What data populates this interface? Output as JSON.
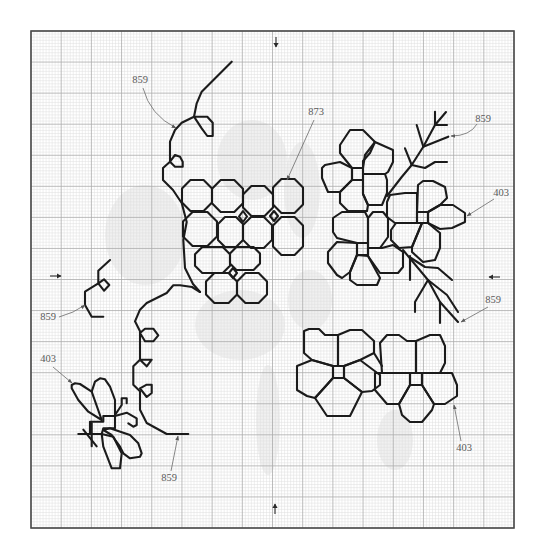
{
  "canvas": {
    "width": 543,
    "height": 556
  },
  "grid": {
    "x0": 31,
    "y0": 31,
    "x1": 514,
    "y1": 528,
    "cols": 160,
    "rows": 160,
    "major_every": 10
  },
  "colors": {
    "stitch": "#1b1b1b",
    "grid_minor": "#dedede",
    "grid_major": "#ababab",
    "frame": "#4a4a4a",
    "label": "#5a5a5a"
  },
  "floss_codes": [
    "403",
    "859",
    "873"
  ],
  "center_markers": [
    {
      "name": "top-center-arrow",
      "dir": "down",
      "x": 276,
      "y1": 37,
      "y2": 47
    },
    {
      "name": "bottom-center-arrow",
      "dir": "up",
      "x": 275,
      "y1": 514,
      "y2": 504
    },
    {
      "name": "left-center-arrow",
      "dir": "right",
      "y": 276,
      "x1": 50,
      "x2": 61
    },
    {
      "name": "right-center-arrow",
      "dir": "left",
      "y": 277,
      "x1": 500,
      "x2": 489
    }
  ],
  "ghost_areas": [
    {
      "cx": 252,
      "cy": 160,
      "rx": 35,
      "ry": 40
    },
    {
      "cx": 145,
      "cy": 235,
      "rx": 40,
      "ry": 50
    },
    {
      "cx": 240,
      "cy": 325,
      "rx": 45,
      "ry": 35
    },
    {
      "cx": 268,
      "cy": 420,
      "rx": 12,
      "ry": 55
    },
    {
      "cx": 310,
      "cy": 300,
      "rx": 22,
      "ry": 30
    },
    {
      "cx": 395,
      "cy": 440,
      "rx": 18,
      "ry": 30
    },
    {
      "cx": 302,
      "cy": 190,
      "rx": 18,
      "ry": 48
    }
  ],
  "labels": [
    {
      "text": "859",
      "x": 140,
      "y": 83,
      "leader": "M143,88 Q150,115 176,128",
      "arrow": true
    },
    {
      "text": "873",
      "x": 316,
      "y": 115,
      "leader": "M314,120 L287,180",
      "arrow": true
    },
    {
      "text": "859",
      "x": 483,
      "y": 122,
      "leader": "M477,124 Q470,136 451,136",
      "arrow": true
    },
    {
      "text": "403",
      "x": 501,
      "y": 196,
      "leader": "M494,199 L467,216",
      "arrow": true
    },
    {
      "text": "859",
      "x": 48,
      "y": 320,
      "leader": "M59,317 Q74,313 85,305",
      "arrow": true
    },
    {
      "text": "859",
      "x": 493,
      "y": 303,
      "leader": "M488,307 L461,322",
      "arrow": true
    },
    {
      "text": "403",
      "x": 48,
      "y": 362,
      "leader": "M53,367 L72,383",
      "arrow": true
    },
    {
      "text": "859",
      "x": 169,
      "y": 481,
      "leader": "M171,471 L178,436",
      "arrow": true
    },
    {
      "text": "403",
      "x": 464,
      "y": 451,
      "leader": "M461,441 L454,405",
      "arrow": true
    }
  ],
  "backstitch": [
    {
      "floss": "859",
      "name": "vines-and-branches",
      "paths": [
        {
          "pts": "231.7,61.7 201.7,91.7 196.7,103.3 194,116.7 181.7,122.7 175,130 170,141.7 170,161.7 163,168 163,180 173,190 181.7,203 186.7,222 183.3,240 185,268 193,284 200,292"
        },
        {
          "pts": "194,116.7 207.3,116.7 212.7,122.7 212.7,136 207.3,136 201.7,128.3",
          "closed": true
        },
        {
          "pts": "170,161.7 175,155 180,156.7 182.7,161.7 182.7,166.7 175,166.7",
          "closed": true
        },
        {
          "pts": "200,292 192,287 180,285.3 173.3,285.3 166.7,293 146.7,303 140,309.7 135,321.3 140,331.3 140,359.7 133.3,366.3 133.3,384.7 140,391.3 140,409.7 146.7,423 166.7,434 188.3,434"
        },
        {
          "pts": "140,333 145,328.7 153.3,328.7 158.3,335.3 153.3,341.3 145,341.3",
          "closed": true
        },
        {
          "pts": "140,359.7 151.7,359.7 146.7,366.3",
          "closed": true
        },
        {
          "pts": "140,388.3 146.7,384.7 151.7,384.7 151.7,393 146.7,397",
          "closed": true
        },
        {
          "pts": "110,260 98.3,270.7 98.3,283.3 85,291.7 85,305 91.7,316.7 103.3,316.7"
        },
        {
          "pts": "98.3,283.3 104,279.3 109.3,285 104,290.7",
          "closed": true
        },
        {
          "pts": "387,196 401.7,177 411.7,165 423.3,146.7 435,125 446,112"
        },
        {
          "pts": "411.7,165 405,148.3"
        },
        {
          "pts": "411.7,165 425,168 435,162 447,162"
        },
        {
          "pts": "423.3,146.7 416.7,125"
        },
        {
          "pts": "423.3,146.7 448.3,136.7"
        },
        {
          "pts": "435,125 435,111.7"
        },
        {
          "pts": "435,125 447,125"
        },
        {
          "pts": "403,250 428,280 440,302 458,322"
        },
        {
          "pts": "411,258 425,267 438,268 452,280"
        },
        {
          "pts": "410,256 410,280"
        },
        {
          "pts": "428,280 415,302 415,312"
        },
        {
          "pts": "428,280 447,295 458,312"
        },
        {
          "pts": "440,302 440,323"
        }
      ]
    },
    {
      "floss": "873",
      "name": "small-flower-cluster",
      "octagons": [
        [
          182,
          180,
          212,
          211
        ],
        [
          212,
          180,
          243,
          212
        ],
        [
          243,
          186,
          273,
          216
        ],
        [
          273,
          179,
          303,
          213
        ],
        [
          183,
          212,
          217,
          246
        ],
        [
          218,
          217,
          243,
          247
        ],
        [
          243,
          217,
          272,
          248
        ],
        [
          273,
          217,
          303,
          255
        ],
        [
          195,
          247,
          230,
          273
        ],
        [
          230,
          247,
          260,
          270
        ],
        [
          206,
          273,
          237,
          303
        ],
        [
          237,
          273,
          267,
          303
        ]
      ],
      "paths": [
        {
          "pts": "243,211 247,216.5 243,222 239,216.5",
          "closed": true
        },
        {
          "pts": "274,211 278,216 274,221 270,216",
          "closed": true
        },
        {
          "pts": "233,268 237,273 233,278 229,273",
          "closed": true
        }
      ]
    },
    {
      "floss": "403",
      "name": "flowers-and-bee",
      "paths": [
        {
          "pts": "340,145 350,130 363,130 375,142 370,153 363,161 363,168 352,168 340,153",
          "closed": true
        },
        {
          "pts": "363,168 365,155 375,142 393,150 393,162 388,172 385,174 363,174",
          "closed": true
        },
        {
          "pts": "352,168 340,162 325,165 322,168 322,178 328,192 340,192 352,180",
          "closed": true
        },
        {
          "pts": "352,180 340,192 340,203 348,211 367,211 368,205 363,194 363,180",
          "closed": true
        },
        {
          "pts": "363,174 385,174 387,180 387,193 382,205 368,205 363,194",
          "closed": true
        },
        {
          "pts": "352,168 363,168 363,180 352,180",
          "closed": true
        },
        {
          "pts": "333,218 342,212 365,212 368,218 368,243 357,243 337,238 333,232",
          "closed": true
        },
        {
          "pts": "368,218 373,212 383,212 388,218 388,237 380,248 368,248",
          "closed": true
        },
        {
          "pts": "357,243 337,242 328,252 328,263 337,275 342,278 350,272 357,255",
          "closed": true
        },
        {
          "pts": "357,255 350,272 350,280 357,285 377,285 380,278 368,256",
          "closed": true
        },
        {
          "pts": "368,248 382,248 393,245 403,252 403,267 398,273 380,273 368,256",
          "closed": true
        },
        {
          "pts": "357,243 368,243 368,255 357,255",
          "closed": true
        },
        {
          "pts": "417,212 418,185 423,181 433,181 445,187 447,198 440,205 428,212",
          "closed": true
        },
        {
          "pts": "428,212 440,205 453,205 465,213 465,222 452,228 440,229 428,223",
          "closed": true
        },
        {
          "pts": "428,223 440,233 440,248 435,260 423,262 412,252 412,247 422,223",
          "closed": true
        },
        {
          "pts": "417,212 417,193 405,193 390,195 387,202 387,217 395,223 417,223",
          "closed": true
        },
        {
          "pts": "417,223 396,223 391,230 391,240 399,248 412,247 422,223",
          "closed": true
        },
        {
          "pts": "417,212 428,212 428,223 417,223",
          "closed": true
        },
        {
          "pts": "304,331 309,329 319,329 325,335 338,335 338,366 333,366 312,360 304,353",
          "closed": true
        },
        {
          "pts": "338,335 350,330 362,330 374,341 374,353 360,360 344,366 338,366",
          "closed": true
        },
        {
          "pts": "333,366 312,360 297,366 297,390 307,396 315,398 333,378",
          "closed": true
        },
        {
          "pts": "344,366 360,360 380,375 380,385 372,391 362,392 344,378",
          "closed": true
        },
        {
          "pts": "333,378 315,398 327,416 350,416 362,392 344,378",
          "closed": true
        },
        {
          "pts": "333,366 344,366 344,378 333,378",
          "closed": true
        },
        {
          "pts": "382,373 380,343 387,335 399,335 407,341 416,341 416,373",
          "closed": true
        },
        {
          "pts": "416,341 430,335 440,335 445,346 445,363 440,373 416,373",
          "closed": true
        },
        {
          "pts": "375,373 410,373 410,385 399,404 387,404 375,390",
          "closed": true
        },
        {
          "pts": "422,373 452,373 457,385 457,396 445,404 434,404 422,385",
          "closed": true
        },
        {
          "pts": "410,385 399,404 402,415 410,422 422,422 432,410 434,404 422,385",
          "closed": true
        },
        {
          "pts": "410,373 422,373 422,385 410,385",
          "closed": true
        },
        {
          "pts": "374,353 382,366"
        },
        {
          "pts": "71.7,385 75,383.3 80,384 91.7,391.7 101.7,420 88.3,411.7 78.3,400 71.7,388.3",
          "closed": true
        },
        {
          "pts": "91.7,391.7 95,381.7 100,378.3 105,379.3 110,386.7 115,400 115,415"
        },
        {
          "pts": "90,421.7 103.3,421.7 103.3,416 115,416 115,428.3 103.3,428.3 101.7,434 90,434",
          "closed": true
        },
        {
          "pts": "115,415 121.7,405 121.7,398.3 126.7,398.3 126.7,403.3"
        },
        {
          "pts": "115,416 126.7,412.7 136.7,418.3 136.7,425 133.3,426.7 128.3,423.3"
        },
        {
          "pts": "103.3,430 110,428.3 130,435 138.3,443.3 141.7,453.3 140,456.7 130,458.3 123.3,453.3 120,446.7 111.7,435",
          "closed": true
        },
        {
          "pts": "101.7,434 103.3,446.7 111.7,468.3 120,468.3 121.7,453.3 113.3,436.7",
          "closed": true
        },
        {
          "pts": "78.3,434 91.7,434"
        },
        {
          "pts": "83.3,429.7 96.7,446.3"
        },
        {
          "pts": "91.7,423 91.7,446.3"
        }
      ]
    }
  ]
}
